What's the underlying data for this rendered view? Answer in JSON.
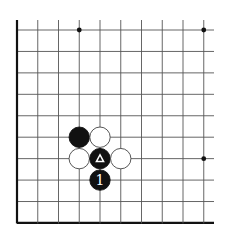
{
  "board": {
    "section": "lower-left corner fragment",
    "columns": 10,
    "rows": 10,
    "origin_x": 17,
    "origin_y": 30,
    "col_spacing": 20.75,
    "row_spacing": 21.44,
    "right_extent": 214,
    "left_edge_is_border": true,
    "bottom_edge_is_border": true,
    "line_color": "#555555",
    "border_color": "#111111",
    "star_points": [
      {
        "col": 3,
        "row": 0
      },
      {
        "col": 9,
        "row": 0
      },
      {
        "col": 9,
        "row": 6
      }
    ]
  },
  "stones": [
    {
      "color": "black",
      "col": 3,
      "row": 5,
      "label": ""
    },
    {
      "color": "white",
      "col": 4,
      "row": 5,
      "label": ""
    },
    {
      "color": "white",
      "col": 3,
      "row": 6,
      "label": ""
    },
    {
      "color": "black",
      "col": 4,
      "row": 6,
      "label": "△",
      "marker": "triangle"
    },
    {
      "color": "white",
      "col": 5,
      "row": 6,
      "label": ""
    },
    {
      "color": "black",
      "col": 4,
      "row": 7,
      "label": "1"
    }
  ]
}
